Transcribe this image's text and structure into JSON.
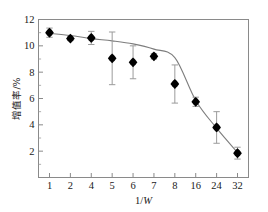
{
  "figure": {
    "background_color": "#ffffff",
    "frame_color": "#8a8a8a",
    "marker_color": "#000000",
    "curve_color": "#7d7d7d",
    "errorbar_color": "#9b9b9b"
  },
  "chart_data": {
    "type": "scatter",
    "title": "",
    "subtitle": "",
    "xlabel": "1/W",
    "xlabel_plain": "1/",
    "xlabel_italic": "W",
    "ylabel": "增值率/%",
    "categories": [
      "1",
      "2",
      "4",
      "5",
      "6",
      "7",
      "8",
      "16",
      "24",
      "32"
    ],
    "x": [
      1,
      2,
      4,
      5,
      6,
      7,
      8,
      16,
      24,
      32
    ],
    "values": [
      11.0,
      10.55,
      10.6,
      9.05,
      8.75,
      9.2,
      7.1,
      5.75,
      3.8,
      1.85
    ],
    "errors": [
      0.35,
      0.15,
      0.5,
      2.0,
      1.25,
      0.2,
      1.45,
      0.35,
      1.2,
      0.45
    ],
    "error_upper": [
      11.35,
      10.7,
      11.1,
      11.05,
      10.0,
      9.4,
      8.55,
      6.1,
      5.0,
      2.3
    ],
    "error_lower": [
      10.65,
      10.4,
      10.1,
      7.05,
      7.5,
      9.0,
      5.65,
      5.4,
      2.6,
      1.4
    ],
    "fit_curve": [
      [
        1,
        10.95
      ],
      [
        2,
        10.78
      ],
      [
        4,
        10.55
      ],
      [
        5,
        10.38
      ],
      [
        6,
        10.15
      ],
      [
        7,
        9.75
      ],
      [
        8,
        9.1
      ],
      [
        16,
        5.85
      ],
      [
        24,
        3.75
      ],
      [
        32,
        1.9
      ]
    ],
    "xlim_categorical": true,
    "ylim": [
      0,
      12
    ],
    "yticks": [
      0,
      2,
      4,
      6,
      8,
      10,
      12
    ],
    "ytick_labels": [
      "",
      "2",
      "4",
      "6",
      "8",
      "10",
      "12"
    ],
    "yminor_step": 1,
    "grid": false,
    "legend": "none",
    "marker_shape": "filled-diamond",
    "series": [
      {
        "name": "增值率",
        "values": [
          11.0,
          10.55,
          10.6,
          9.05,
          8.75,
          9.2,
          7.1,
          5.75,
          3.8,
          1.85
        ]
      }
    ]
  }
}
